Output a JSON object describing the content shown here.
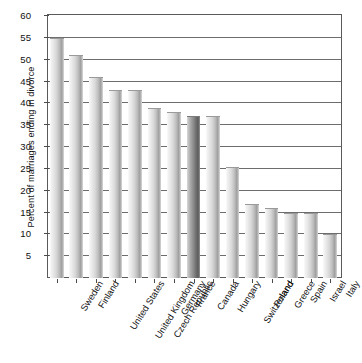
{
  "chart_data": {
    "type": "bar",
    "title": "",
    "subtitle": "",
    "xlabel": "",
    "ylabel": "Percent of marriages ending in divorce",
    "ylim": [
      0,
      60
    ],
    "ytick_step": 5,
    "yticks": [
      0,
      5,
      10,
      15,
      20,
      25,
      30,
      35,
      40,
      45,
      50,
      55,
      60
    ],
    "ytick_labels": [
      "",
      "5",
      "10",
      "15",
      "20",
      "25",
      "30",
      "35",
      "40",
      "45",
      "50",
      "55",
      "60"
    ],
    "grid": true,
    "grid_axis": "y",
    "legend": false,
    "legend_position": "none",
    "orientation": "vertical",
    "categories": [
      "Sweden",
      "Finland",
      "United States",
      "United Kingdom",
      "Czech Republic",
      "Germany",
      "France",
      "Canada",
      "Hungary",
      "Switzerland",
      "Poland",
      "Greece",
      "Spain",
      "Israel",
      "Italy"
    ],
    "values": [
      55,
      51,
      46,
      43,
      43,
      39,
      38,
      37,
      37,
      25.5,
      17,
      16,
      15,
      15,
      10
    ],
    "highlighted_categories": [
      "Canada"
    ],
    "colors": {
      "bar_light": "#e6e6e6",
      "bar_shadow": "#9e9e9e",
      "bar_highlight_light": "#c0c0c0",
      "bar_highlight_shadow": "#5c5c5c",
      "gridline": "#6d6d6d",
      "axis": "#5a5a5a",
      "text": "#111111",
      "background": "#ffffff"
    }
  }
}
